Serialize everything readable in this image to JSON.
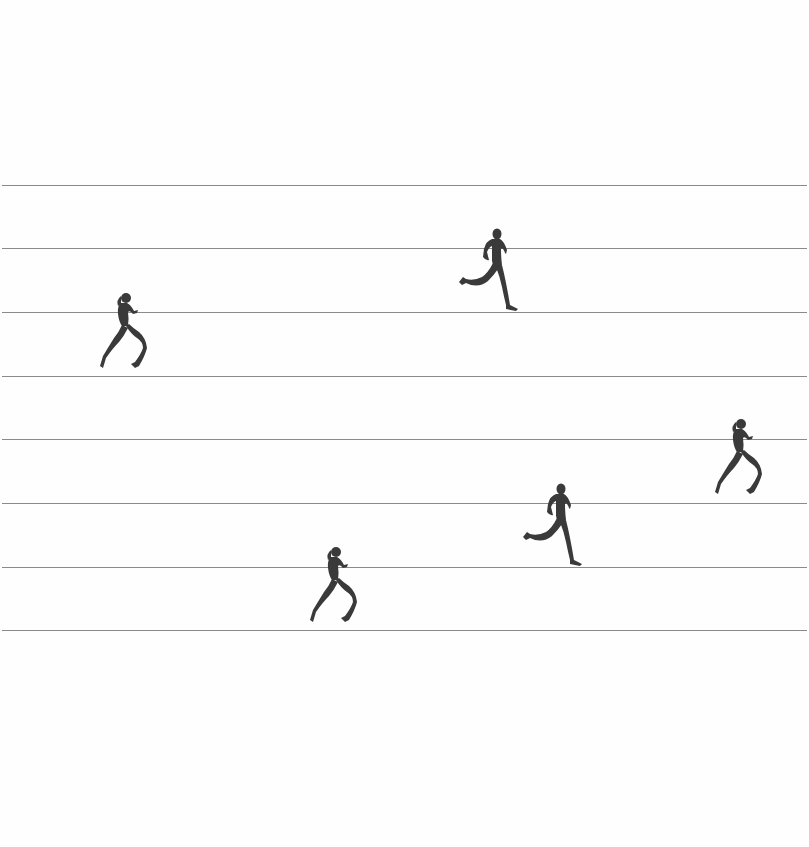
{
  "scene": {
    "background": "#fefefe",
    "line_color": "#8a8a8a",
    "figure_color": "#3a3a3a",
    "lines": [
      {
        "y": 185
      },
      {
        "y": 248
      },
      {
        "y": 312
      },
      {
        "y": 376
      },
      {
        "y": 439
      },
      {
        "y": 503
      },
      {
        "y": 567
      },
      {
        "y": 630
      }
    ],
    "runners": [
      {
        "id": "runner-1",
        "type": "female",
        "lane": 3,
        "x": 97,
        "y": 292,
        "w": 50,
        "h": 84
      },
      {
        "id": "runner-2",
        "type": "male",
        "lane": 2,
        "x": 456,
        "y": 227,
        "w": 65,
        "h": 86
      },
      {
        "id": "runner-3",
        "type": "female",
        "lane": 5,
        "x": 712,
        "y": 418,
        "w": 50,
        "h": 84
      },
      {
        "id": "runner-4",
        "type": "male",
        "lane": 6,
        "x": 520,
        "y": 482,
        "w": 65,
        "h": 86
      },
      {
        "id": "runner-5",
        "type": "female",
        "lane": 7,
        "x": 307,
        "y": 546,
        "w": 50,
        "h": 84
      }
    ]
  }
}
